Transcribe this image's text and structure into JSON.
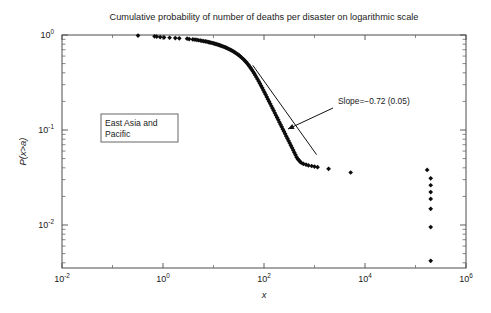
{
  "chart_data": {
    "type": "scatter",
    "title": "Cumulative probability of number of deaths per disaster on logarithmic scale",
    "xlabel": "x",
    "ylabel": "P(x>a)",
    "xscale": "log",
    "yscale": "log",
    "xlim": [
      0.01,
      1000000
    ],
    "ylim": [
      0.003,
      1.2
    ],
    "grid": false,
    "legend": null,
    "xticks": [
      {
        "value": 0.01,
        "label": "10",
        "exponent": "-2"
      },
      {
        "value": 1,
        "label": "10",
        "exponent": "0"
      },
      {
        "value": 100,
        "label": "10",
        "exponent": "2"
      },
      {
        "value": 10000,
        "label": "10",
        "exponent": "4"
      },
      {
        "value": 1000000,
        "label": "10",
        "exponent": "6"
      }
    ],
    "yticks": [
      {
        "value": 1,
        "label": "10",
        "exponent": "0"
      },
      {
        "value": 0.1,
        "label": "10",
        "exponent": "-1"
      },
      {
        "value": 0.01,
        "label": "10",
        "exponent": "-2"
      }
    ],
    "annotations": [
      {
        "name": "slope-annotation",
        "text": "Slope=−0.72 (0.05)",
        "x_px": 338,
        "y_px": 104,
        "arrow_from_px": [
          333,
          108
        ],
        "arrow_to_px": [
          288,
          129
        ]
      },
      {
        "name": "region-label-box",
        "text_lines": [
          "East Asia and",
          "Pacific"
        ],
        "x_px": 101,
        "y_px": 114,
        "width_px": 77,
        "height_px": 28
      }
    ],
    "fit_line": {
      "name": "power-law-fit",
      "slope": -0.72,
      "slope_error": 0.05,
      "x_start": 60,
      "x_end": 1100,
      "y_start": 0.48,
      "y_end": 0.055
    },
    "marker": "diamond",
    "marker_color": "#0d0d0d",
    "series": [
      {
        "name": "East Asia and Pacific",
        "points": [
          [
            0.32,
            0.985
          ],
          [
            0.68,
            0.968
          ],
          [
            0.75,
            0.962
          ],
          [
            0.88,
            0.952
          ],
          [
            1.05,
            0.944
          ],
          [
            1.35,
            0.935
          ],
          [
            1.75,
            0.928
          ],
          [
            2.1,
            0.922
          ],
          [
            3.0,
            0.915
          ],
          [
            3.3,
            0.906
          ],
          [
            3.9,
            0.899
          ],
          [
            4.3,
            0.893
          ],
          [
            4.7,
            0.887
          ],
          [
            5.1,
            0.881
          ],
          [
            5.5,
            0.875
          ],
          [
            5.9,
            0.869
          ],
          [
            6.4,
            0.862
          ],
          [
            6.9,
            0.856
          ],
          [
            7.4,
            0.85
          ],
          [
            7.9,
            0.843
          ],
          [
            8.4,
            0.837
          ],
          [
            8.9,
            0.83
          ],
          [
            9.4,
            0.824
          ],
          [
            10.0,
            0.817
          ],
          [
            10.6,
            0.81
          ],
          [
            11.2,
            0.803
          ],
          [
            11.8,
            0.796
          ],
          [
            12.5,
            0.788
          ],
          [
            13.2,
            0.781
          ],
          [
            13.9,
            0.773
          ],
          [
            14.7,
            0.765
          ],
          [
            15.5,
            0.757
          ],
          [
            16.3,
            0.748
          ],
          [
            17.2,
            0.74
          ],
          [
            18.1,
            0.731
          ],
          [
            19.1,
            0.722
          ],
          [
            20.1,
            0.712
          ],
          [
            21.2,
            0.702
          ],
          [
            22.3,
            0.692
          ],
          [
            23.5,
            0.681
          ],
          [
            24.8,
            0.67
          ],
          [
            26.1,
            0.659
          ],
          [
            27.5,
            0.647
          ],
          [
            29.0,
            0.635
          ],
          [
            30.6,
            0.622
          ],
          [
            32.2,
            0.609
          ],
          [
            34.0,
            0.595
          ],
          [
            35.8,
            0.581
          ],
          [
            37.7,
            0.566
          ],
          [
            39.8,
            0.551
          ],
          [
            41.9,
            0.535
          ],
          [
            44.2,
            0.519
          ],
          [
            46.6,
            0.502
          ],
          [
            49.1,
            0.485
          ],
          [
            51.7,
            0.467
          ],
          [
            54.5,
            0.449
          ],
          [
            57.4,
            0.431
          ],
          [
            60.5,
            0.413
          ],
          [
            63.8,
            0.395
          ],
          [
            67.2,
            0.377
          ],
          [
            70.8,
            0.359
          ],
          [
            74.6,
            0.342
          ],
          [
            78.6,
            0.325
          ],
          [
            82.8,
            0.309
          ],
          [
            87.3,
            0.293
          ],
          [
            92.0,
            0.278
          ],
          [
            96.9,
            0.263
          ],
          [
            102.1,
            0.249
          ],
          [
            107.6,
            0.236
          ],
          [
            113.4,
            0.223
          ],
          [
            119.5,
            0.211
          ],
          [
            125.9,
            0.2
          ],
          [
            132.7,
            0.189
          ],
          [
            139.8,
            0.179
          ],
          [
            147.4,
            0.169
          ],
          [
            155.3,
            0.16
          ],
          [
            163.6,
            0.151
          ],
          [
            172.4,
            0.143
          ],
          [
            181.7,
            0.135
          ],
          [
            191.5,
            0.128
          ],
          [
            201.8,
            0.121
          ],
          [
            212.6,
            0.114
          ],
          [
            224.1,
            0.108
          ],
          [
            236.1,
            0.102
          ],
          [
            248.8,
            0.0965
          ],
          [
            262.2,
            0.0912
          ],
          [
            276.3,
            0.0862
          ],
          [
            291.1,
            0.0815
          ],
          [
            306.8,
            0.077
          ],
          [
            323.2,
            0.0728
          ],
          [
            340.6,
            0.0688
          ],
          [
            358.9,
            0.065
          ],
          [
            378.2,
            0.0614
          ],
          [
            398.5,
            0.058
          ],
          [
            419.9,
            0.0548
          ],
          [
            442.5,
            0.0518
          ],
          [
            466.3,
            0.0496
          ],
          [
            491.4,
            0.048
          ],
          [
            517.8,
            0.0465
          ],
          [
            545.6,
            0.0452
          ],
          [
            600.0,
            0.0441
          ],
          [
            680.0,
            0.0432
          ],
          [
            760.0,
            0.0424
          ],
          [
            880.0,
            0.0418
          ],
          [
            1000.0,
            0.0412
          ],
          [
            1150.0,
            0.0406
          ],
          [
            1900.0,
            0.039
          ],
          [
            5200.0,
            0.0357
          ],
          [
            170000.0,
            0.038
          ],
          [
            200000.0,
            0.031
          ],
          [
            200000.0,
            0.0262
          ],
          [
            200000.0,
            0.0222
          ],
          [
            200000.0,
            0.0188
          ],
          [
            200000.0,
            0.0148
          ],
          [
            200000.0,
            0.0095
          ],
          [
            200000.0,
            0.0042
          ]
        ]
      }
    ]
  }
}
